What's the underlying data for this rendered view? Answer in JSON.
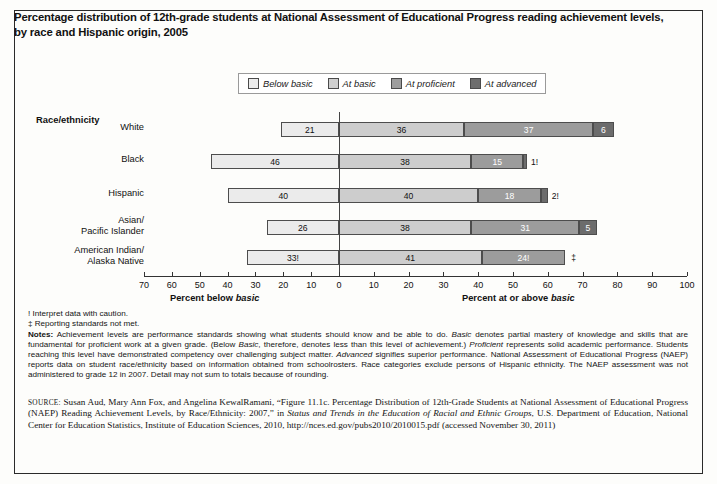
{
  "title": "Percentage distribution of 12th-grade students at National Assessment of Educational Progress reading achievement levels, by race and Hispanic origin, 2005",
  "legend": {
    "items": [
      {
        "label": "Below basic",
        "color": "#ececec"
      },
      {
        "label": "At basic",
        "color": "#cfcfcf"
      },
      {
        "label": "At proficient",
        "color": "#9d9d9d"
      },
      {
        "label": "At advanced",
        "color": "#6d6d6d"
      }
    ]
  },
  "axis_heading": "Race/ethnicity",
  "xlabel_left": "Percent below ",
  "xlabel_left_italic": "basic",
  "xlabel_right": "Percent at or above ",
  "xlabel_right_italic": "basic",
  "footnotes": {
    "dagger_excl": "! Interpret data with caution.",
    "double_dagger": "‡ Reporting standards not met.",
    "notes_label": "Notes:",
    "notes_text": " Achievement levels are performance standards showing what students should know and be able to do. Basic denotes partial mastery of knowledge and skills that are fundamental for proficient work at a given grade. (Below Basic, therefore, denotes less than this level of achievement.) Proficient represents solid academic performance. Students reaching this level have demonstrated competency over challenging subject matter. Advanced signifies superior performance. National Assessment of Educational Progress (NAEP) reports data on student race/ethnicity based on information obtained from schoolrosters. Race categories exclude persons of Hispanic ethnicity. The NAEP assessment was not administered to grade 12 in 2007. Detail may not sum to totals because of rounding."
  },
  "source": {
    "label": "SOURCE:",
    "text": " Susan Aud, Mary Ann Fox, and Angelina KewalRamani, “Figure 11.1c. Percentage Distribution of 12th-Grade Students at National Assessment of Educational Progress (NAEP) Reading Achievement Levels, by Race/Ethnicity: 2007,” in Status and Trends in the Education of Racial and Ethnic Groups, U.S. Department of Education, National Center for Education Statistics, Institute of Education Sciences, 2010, http://nces.ed.gov/pubs2010/2010015.pdf (accessed November 30, 2011)"
  },
  "chart_data": {
    "type": "bar",
    "orientation": "horizontal",
    "stacked": true,
    "diverging": true,
    "title": "Percentage distribution of 12th-grade students at National Assessment of Educational Progress reading achievement levels, by race and Hispanic origin, 2005",
    "xlabel": "Percent below basic / Percent at or above basic",
    "ylabel": "Race/ethnicity",
    "xlim": [
      -70,
      100
    ],
    "xticks": [
      70,
      60,
      50,
      40,
      30,
      20,
      10,
      0,
      10,
      20,
      30,
      40,
      50,
      60,
      70,
      80,
      90,
      100
    ],
    "grid": false,
    "legend_position": "top-center",
    "categories": [
      "White",
      "Black",
      "Hispanic",
      "Asian/\nPacific Islander",
      "American Indian/\nAlaska Native"
    ],
    "series": [
      {
        "name": "Below basic",
        "values": [
          21,
          46,
          40,
          26,
          33
        ],
        "labels": [
          "21",
          "46",
          "40",
          "26",
          "33!"
        ]
      },
      {
        "name": "At basic",
        "values": [
          36,
          38,
          40,
          38,
          41
        ],
        "labels": [
          "36",
          "38",
          "40",
          "38",
          "41"
        ]
      },
      {
        "name": "At proficient",
        "values": [
          37,
          15,
          18,
          31,
          24
        ],
        "labels": [
          "37",
          "15",
          "18",
          "31",
          "24!"
        ]
      },
      {
        "name": "At advanced",
        "values": [
          6,
          1,
          2,
          5,
          null
        ],
        "labels": [
          "6",
          "1!",
          "2!",
          "5",
          "‡"
        ]
      }
    ]
  }
}
